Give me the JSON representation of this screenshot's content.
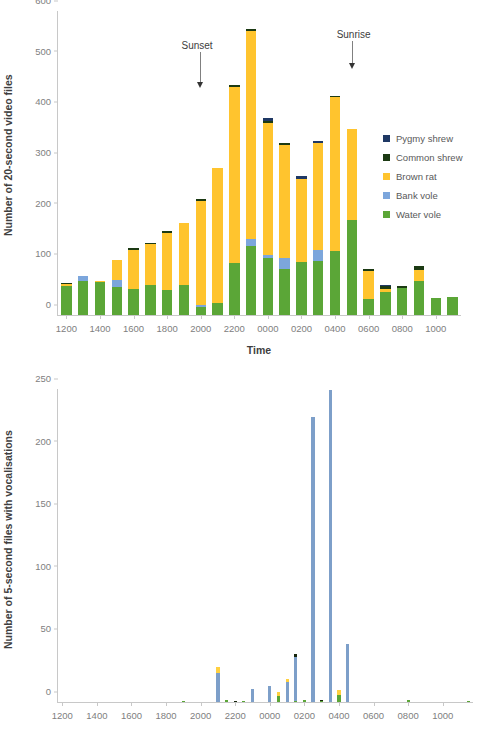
{
  "colors": {
    "pygmy_shrew": "#1F3864",
    "common_shrew": "#1C3A13",
    "brown_rat": "#FFC42E",
    "bank_vole": "#7CA6DC",
    "water_vole": "#5BA637",
    "brown_rat_blue": "#7D9FC9",
    "common_shrew_yellow": "#FFD040",
    "pygmy_shrew_dark": "#16250B",
    "axis": "#C8C8C8",
    "text": "#595959"
  },
  "top": {
    "ylabel": "Number of 20-second video files",
    "xlabel": "Time",
    "yticks": [
      0,
      100,
      200,
      300,
      400,
      500,
      600
    ],
    "xticks": [
      "1200",
      "1400",
      "1600",
      "1800",
      "2000",
      "2200",
      "0000",
      "0200",
      "0400",
      "0600",
      "0800",
      "1000"
    ],
    "legend": [
      {
        "label": "Pygmy shrew",
        "color": "#1F3864"
      },
      {
        "label": "Common shrew",
        "color": "#1C3A13"
      },
      {
        "label": "Brown rat",
        "color": "#FFC42E"
      },
      {
        "label": "Bank vole",
        "color": "#7CA6DC"
      },
      {
        "label": "Water vole",
        "color": "#5BA637"
      }
    ],
    "annotations": [
      {
        "label": "Sunset",
        "category": "2000"
      },
      {
        "label": "Sunrise",
        "category": "0500"
      }
    ]
  },
  "bottom": {
    "ylabel": "Number of 5-second files with vocalisations",
    "yticks": [
      0,
      50,
      100,
      150,
      200,
      250
    ],
    "xticks": [
      "1200",
      "1400",
      "1600",
      "1800",
      "2000",
      "2200",
      "0000",
      "0200",
      "0400",
      "0600",
      "0800",
      "1000"
    ],
    "legend": [
      {
        "label": "Water vole",
        "color": "#5BA637"
      },
      {
        "label": "Brown rat",
        "color": "#7D9FC9"
      },
      {
        "label": "Common shrew",
        "color": "#FFD040"
      },
      {
        "label": "Pygmy shrew",
        "color": "#16250B"
      }
    ]
  },
  "chart_data": [
    {
      "type": "bar",
      "id": "video-files-by-hour",
      "stacked": true,
      "title": "",
      "xlabel": "Time",
      "ylabel": "Number of 20-second video files",
      "ylim": [
        0,
        600
      ],
      "yticks": [
        0,
        100,
        200,
        300,
        400,
        500,
        600
      ],
      "grid": false,
      "legend_position": "right",
      "categories": [
        "1200",
        "1300",
        "1400",
        "1500",
        "1600",
        "1700",
        "1800",
        "1900",
        "2000",
        "2100",
        "2200",
        "2300",
        "0000",
        "0100",
        "0200",
        "0300",
        "0400",
        "0500",
        "0600",
        "0700",
        "0800",
        "0900",
        "1000",
        "1100"
      ],
      "series": [
        {
          "name": "Water vole",
          "color": "#5BA637",
          "values": [
            60,
            67,
            66,
            56,
            52,
            59,
            50,
            60,
            15,
            23,
            104,
            136,
            113,
            91,
            104,
            107,
            126,
            188,
            32,
            45,
            54,
            67,
            34,
            36
          ]
        },
        {
          "name": "Bank vole",
          "color": "#7CA6DC",
          "values": [
            0,
            11,
            0,
            14,
            0,
            0,
            0,
            0,
            5,
            0,
            0,
            14,
            6,
            21,
            0,
            21,
            0,
            0,
            0,
            0,
            0,
            0,
            0,
            0
          ]
        },
        {
          "name": "Brown rat",
          "color": "#FFC42E",
          "values": [
            2,
            0,
            2,
            39,
            79,
            82,
            114,
            122,
            206,
            268,
            348,
            411,
            262,
            225,
            165,
            212,
            305,
            180,
            57,
            6,
            0,
            22,
            0,
            0
          ]
        },
        {
          "name": "Common shrew",
          "color": "#1C3A13",
          "values": [
            2,
            0,
            0,
            0,
            1,
            2,
            1,
            0,
            2,
            0,
            1,
            4,
            1,
            2,
            0,
            0,
            2,
            0,
            1,
            6,
            4,
            7,
            0,
            0
          ]
        },
        {
          "name": "Pygmy shrew",
          "color": "#1F3864",
          "values": [
            0,
            0,
            0,
            0,
            0,
            0,
            0,
            0,
            0,
            0,
            0,
            0,
            6,
            0,
            5,
            4,
            0,
            0,
            0,
            3,
            0,
            0,
            0,
            0
          ]
        }
      ],
      "totals": [
        64,
        78,
        68,
        109,
        132,
        143,
        165,
        182,
        228,
        291,
        453,
        565,
        388,
        339,
        274,
        344,
        433,
        368,
        90,
        60,
        58,
        96,
        34,
        36
      ],
      "annotations": [
        {
          "text": "Sunset",
          "at_category": "2000"
        },
        {
          "text": "Sunrise",
          "at_category": "0500"
        }
      ]
    },
    {
      "type": "bar",
      "id": "vocalisation-files-by-time",
      "stacked": true,
      "title": "",
      "xlabel": "",
      "ylabel": "Number of 5-second files with vocalisations",
      "ylim": [
        0,
        250
      ],
      "yticks": [
        0,
        50,
        100,
        150,
        200,
        250
      ],
      "grid": false,
      "legend_position": "right",
      "categories": [
        "1200",
        "1230",
        "1300",
        "1330",
        "1400",
        "1430",
        "1500",
        "1530",
        "1600",
        "1630",
        "1700",
        "1730",
        "1800",
        "1830",
        "1900",
        "1930",
        "2000",
        "2030",
        "2100",
        "2130",
        "2200",
        "2230",
        "2300",
        "2330",
        "0000",
        "0030",
        "0100",
        "0130",
        "0200",
        "0230",
        "0300",
        "0330",
        "0400",
        "0430",
        "0500",
        "0530",
        "0600",
        "0630",
        "0700",
        "0730",
        "0800",
        "0830",
        "0900",
        "0930",
        "1000",
        "1030",
        "1100",
        "1130"
      ],
      "series": [
        {
          "name": "Water vole",
          "color": "#5BA637",
          "values": [
            0,
            0,
            0,
            0,
            0,
            0,
            0,
            0,
            0,
            0,
            0,
            0,
            0,
            0,
            1,
            0,
            0,
            0,
            0,
            2,
            0,
            1,
            0,
            0,
            0,
            5,
            0,
            1,
            2,
            0,
            1,
            0,
            6,
            0,
            0,
            0,
            0,
            0,
            0,
            0,
            2,
            0,
            0,
            0,
            0,
            0,
            0,
            1
          ]
        },
        {
          "name": "Brown rat",
          "color": "#7D9FC9",
          "values": [
            0,
            0,
            0,
            0,
            0,
            0,
            0,
            0,
            0,
            0,
            0,
            0,
            0,
            0,
            0,
            0,
            0,
            0,
            23,
            0,
            0,
            0,
            10,
            0,
            13,
            0,
            16,
            35,
            0,
            228,
            0,
            249,
            0,
            46,
            0,
            0,
            0,
            0,
            0,
            0,
            0,
            0,
            0,
            0,
            0,
            0,
            0,
            0
          ]
        },
        {
          "name": "Common shrew",
          "color": "#FFD040",
          "values": [
            0,
            0,
            0,
            0,
            0,
            0,
            0,
            0,
            0,
            0,
            0,
            0,
            0,
            0,
            0,
            0,
            0,
            0,
            5,
            0,
            0,
            0,
            0,
            0,
            0,
            3,
            2,
            0,
            0,
            0,
            0,
            0,
            4,
            0,
            0,
            0,
            0,
            0,
            0,
            0,
            0,
            0,
            0,
            0,
            0,
            0,
            0,
            0
          ]
        },
        {
          "name": "Pygmy shrew",
          "color": "#16250B",
          "values": [
            0,
            0,
            0,
            0,
            0,
            0,
            0,
            0,
            0,
            0,
            0,
            0,
            0,
            0,
            0,
            0,
            0,
            0,
            0,
            0,
            1,
            0,
            0,
            0,
            0,
            0,
            0,
            2,
            0,
            0,
            1,
            0,
            0,
            0,
            0,
            0,
            0,
            0,
            0,
            0,
            0,
            0,
            0,
            0,
            0,
            0,
            0,
            0
          ]
        }
      ]
    }
  ]
}
